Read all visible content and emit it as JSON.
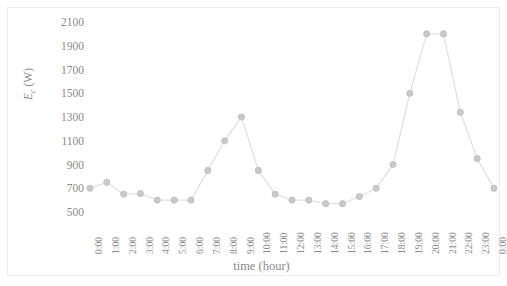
{
  "chart_data": {
    "type": "line",
    "title": "",
    "xlabel": "time (hour)",
    "ylabel": "E_c (W)",
    "ylabel_base": "E",
    "ylabel_sub": "c",
    "ylabel_unit": " (W)",
    "categories": [
      "0:00",
      "1:00",
      "2:00",
      "3:00",
      "4:00",
      "5:00",
      "6:00",
      "7:00",
      "8:00",
      "9:00",
      "10:00",
      "11:00",
      "12:00",
      "13:00",
      "14:00",
      "15:00",
      "16:00",
      "17:00",
      "18:00",
      "19:00",
      "20:00",
      "21:00",
      "22:00",
      "23:00",
      "0:00"
    ],
    "values": [
      700,
      750,
      650,
      655,
      600,
      600,
      600,
      850,
      1100,
      1300,
      850,
      650,
      600,
      600,
      570,
      570,
      630,
      700,
      900,
      1500,
      2000,
      2000,
      1340,
      950,
      700
    ],
    "yticks": [
      500,
      700,
      900,
      1100,
      1300,
      1500,
      1700,
      1900,
      2100
    ],
    "ytick_labels": [
      "500",
      "700",
      "900",
      "1100",
      "1300",
      "1500",
      "1700",
      "1900",
      "2100"
    ],
    "ylim": [
      500,
      2100
    ],
    "grid": false,
    "legend": "none",
    "series_name": "Ec",
    "marker": "circle",
    "colors": {
      "line": "#e2e2e2",
      "marker": "#c9c9c9",
      "marker_edge": "#bdbdbd",
      "text": "#8c8c8c",
      "frame": "#ededed",
      "background": "#ffffff"
    }
  }
}
